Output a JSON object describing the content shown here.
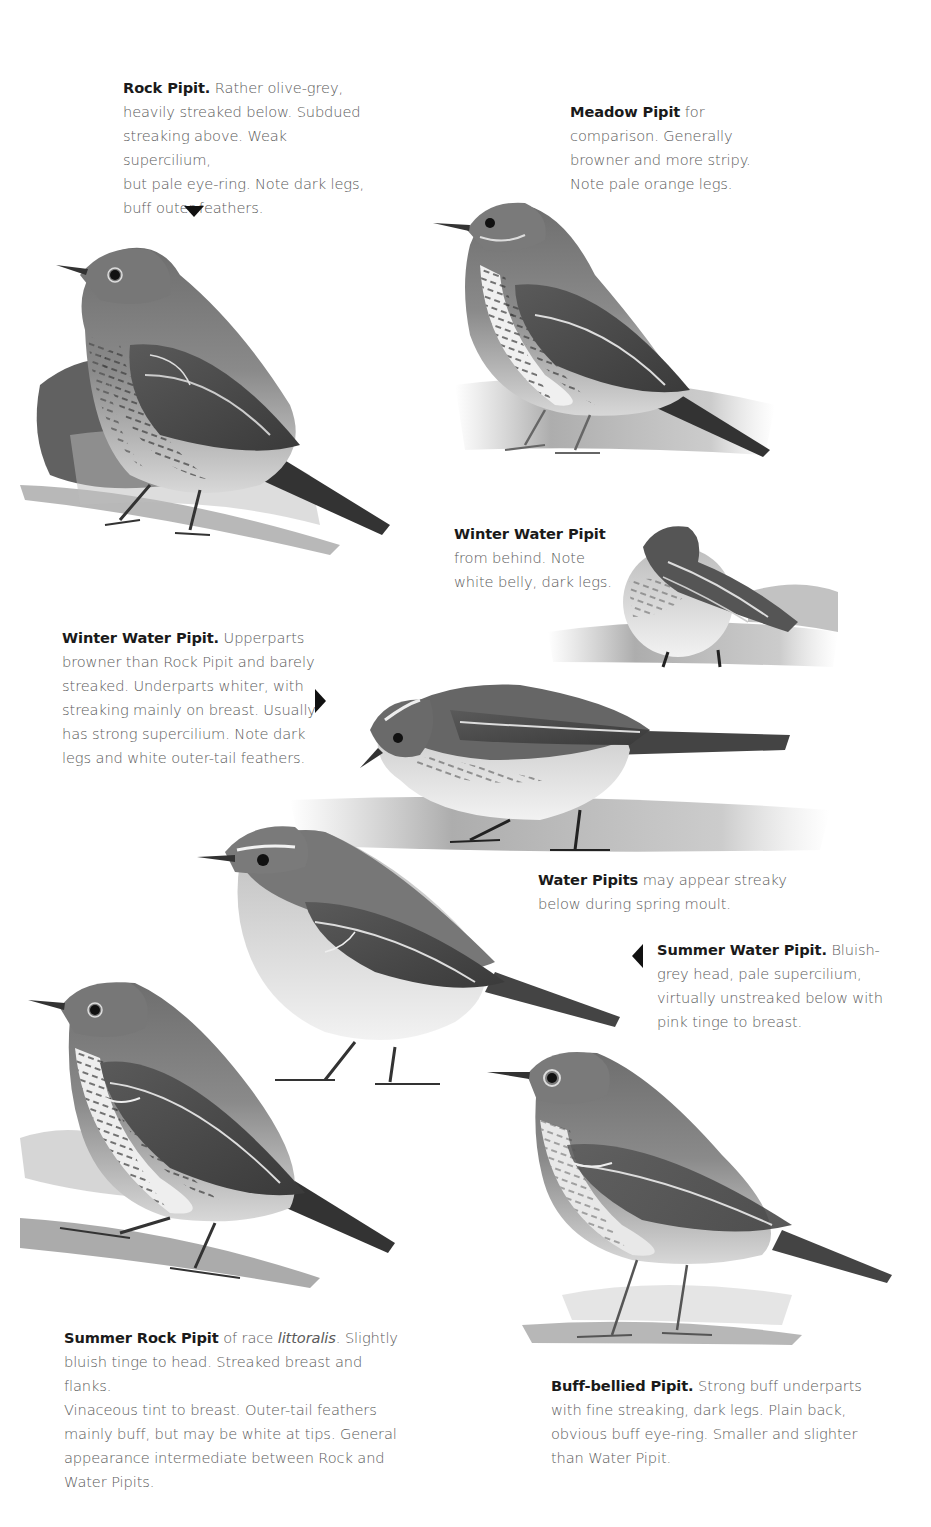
{
  "page": {
    "background": "#ffffff",
    "text_color": "#5a5a5a",
    "heading_color": "#1a1a1a"
  },
  "captions": {
    "rock_pipit": {
      "title": "Rock Pipit.",
      "text": "Rather olive-grey, heavily streaked below. Subdued streaking above. Weak supercilium, but pale eye-ring. Note dark legs, buff outer feathers.",
      "lines": [
        "Rather olive-grey,",
        "heavily streaked below. Subdued",
        "streaking above. Weak supercilium,",
        "but pale eye-ring. Note dark legs,",
        "buff outer feathers."
      ]
    },
    "meadow_pipit": {
      "title": "Meadow Pipit",
      "text": "for comparison. Generally browner and more stripy. Note pale orange legs.",
      "lines": [
        "for",
        "comparison. Generally",
        "browner and more stripy.",
        "Note pale orange legs."
      ]
    },
    "winter_water_pipit_behind": {
      "title": "Winter Water Pipit",
      "text": "from behind. Note white belly, dark legs.",
      "lines": [
        "from behind. Note",
        "white belly, dark legs."
      ]
    },
    "winter_water_pipit": {
      "title": "Winter Water Pipit.",
      "text": "Upperparts browner than Rock Pipit and barely streaked. Underparts whiter, with streaking mainly on breast. Usually has strong supercilium. Note dark legs and white outer-tail feathers.",
      "lines": [
        "Upperparts",
        "browner than Rock Pipit and barely",
        "streaked. Underparts whiter, with",
        "streaking mainly on breast. Usually",
        "has strong supercilium. Note dark",
        "legs and white outer-tail feathers."
      ]
    },
    "water_pipits_moult": {
      "title": "Water Pipits",
      "text": "may appear streaky below during spring moult.",
      "lines": [
        "may appear streaky",
        "below during spring moult."
      ]
    },
    "summer_water_pipit": {
      "title": "Summer Water Pipit.",
      "text": "Bluish-grey head, pale supercilium, virtually unstreaked below with pink tinge to breast.",
      "lines": [
        "Bluish-",
        "grey head, pale supercilium,",
        "virtually unstreaked below with",
        "pink tinge to breast."
      ]
    },
    "summer_rock_pipit": {
      "title": "Summer Rock Pipit",
      "pre_italic": "of race",
      "italic": "littoralis",
      "text": "Slightly bluish tinge to head. Streaked breast and flanks. Vinaceous tint to breast. Outer-tail feathers mainly buff, but may be white at tips. General appearance intermediate between Rock and Water Pipits.",
      "lines": [
        ". Slightly",
        "bluish tinge to head. Streaked breast and flanks.",
        "Vinaceous tint to breast. Outer-tail feathers",
        "mainly buff, but may be white at tips. General",
        "appearance intermediate between Rock and",
        "Water Pipits."
      ]
    },
    "buff_bellied_pipit": {
      "title": "Buff-bellied Pipit.",
      "text": "Strong buff underparts with fine streaking, dark legs. Plain back, obvious buff eye-ring. Smaller and slighter than Water Pipit.",
      "lines": [
        "Strong buff underparts",
        "with fine streaking, dark legs. Plain back,",
        "obvious buff eye-ring. Smaller and slighter",
        "than Water Pipit."
      ]
    }
  },
  "illustrations": [
    {
      "id": "rock-pipit",
      "label": "Rock Pipit illustration"
    },
    {
      "id": "meadow-pipit",
      "label": "Meadow Pipit illustration"
    },
    {
      "id": "winter-water-pipit-behind",
      "label": "Winter Water Pipit from behind illustration"
    },
    {
      "id": "winter-water-pipit",
      "label": "Winter Water Pipit illustration"
    },
    {
      "id": "summer-water-pipit",
      "label": "Summer Water Pipit illustration"
    },
    {
      "id": "summer-rock-pipit",
      "label": "Summer Rock Pipit illustration"
    },
    {
      "id": "buff-bellied-pipit",
      "label": "Buff-bellied Pipit illustration"
    }
  ]
}
